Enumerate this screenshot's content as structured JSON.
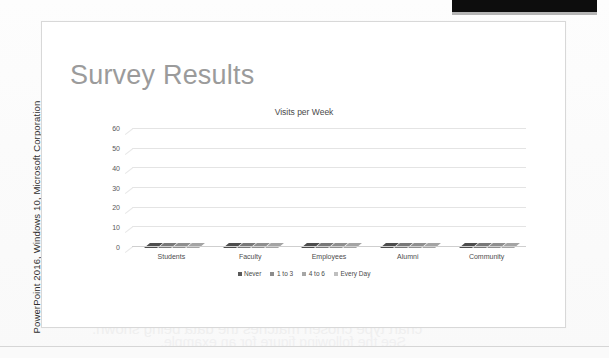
{
  "page": {
    "credit_caption": "PowerPoint 2016, Windows 10, Microsoft Corporation",
    "bleed_through": {
      "title": "Charting a Hypothesis",
      "line1": "the information a chart conveys can be more valuable",
      "line2": "than the equivalent data in a table, so long as the",
      "line3": "chart type chosen matches the data being shown.",
      "line4": "See the following figure for an example."
    }
  },
  "slide": {
    "title": "Survey Results"
  },
  "chart_data": {
    "type": "bar",
    "title": "Visits per Week",
    "xlabel": "",
    "ylabel": "",
    "ylim": [
      0,
      60
    ],
    "yticks": [
      0,
      10,
      20,
      30,
      40,
      50,
      60
    ],
    "grid": true,
    "legend_position": "bottom",
    "three_d": true,
    "categories": [
      "Students",
      "Faculty",
      "Employees",
      "Alumni",
      "Community"
    ],
    "series": [
      {
        "name": "Never",
        "color": "#595959",
        "values": [
          12,
          20,
          26,
          32,
          40
        ]
      },
      {
        "name": "1 to 3",
        "color": "#8c8c8c",
        "values": [
          58,
          62,
          50,
          42,
          31
        ]
      },
      {
        "name": "4 to 6",
        "color": "#a6a6a6",
        "values": [
          27,
          5,
          15,
          20,
          28
        ]
      },
      {
        "name": "Every Day",
        "color": "#bfbfbf",
        "values": [
          10,
          7,
          6,
          11,
          10
        ]
      }
    ]
  },
  "colors": {
    "slide_title": "#9b9b9b",
    "gridline": "#e4e4e4",
    "top_bar": "#0d0d0d"
  }
}
